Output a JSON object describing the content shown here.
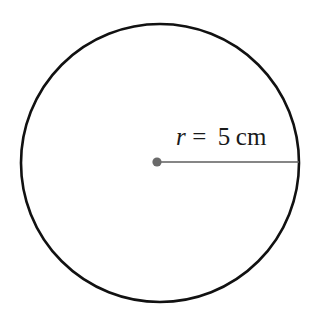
{
  "figure": {
    "kind": "geometry-diagram",
    "background_color": "#ffffff",
    "width": 315,
    "height": 324
  },
  "circle": {
    "stroke_color": "#111111",
    "stroke_width": 2.6,
    "fill": "none",
    "center_x": 160,
    "center_y": 163,
    "radius_px": 139
  },
  "center_point": {
    "label": "center-dot",
    "color": "#6a6a6a",
    "x": 157,
    "y": 162,
    "radius_px": 4.6
  },
  "radius_segment": {
    "color": "#5e5e5e",
    "stroke_width": 1.7,
    "x1": 157,
    "y1": 162,
    "x2": 299,
    "y2": 162
  },
  "label": {
    "full_text": "r = 5 cm",
    "variable": "r",
    "equals": "=",
    "value": "5",
    "unit": "cm",
    "color": "#1a1a1a",
    "font_size_px": 25
  },
  "chart_data": {
    "type": "diagram",
    "title": "",
    "shape": "circle",
    "measurements": [
      {
        "name": "radius",
        "symbol": "r",
        "value": 5,
        "unit": "cm"
      }
    ],
    "annotations": [
      "r = 5 cm"
    ],
    "grid": false,
    "legend": false
  }
}
